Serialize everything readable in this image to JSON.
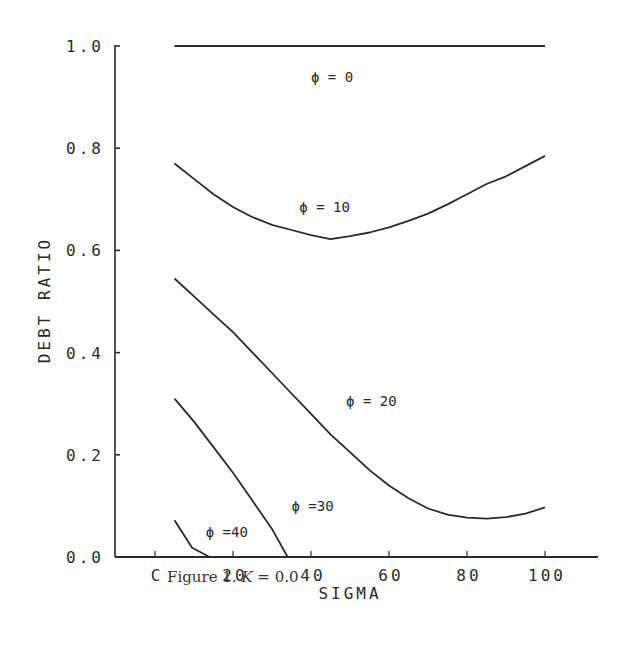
{
  "chart_data": {
    "type": "line",
    "title": "",
    "caption": "Figure 1. K = 0.0",
    "xlabel": "SIGMA",
    "ylabel": "DEBT RATIO",
    "xlim": [
      -10,
      115
    ],
    "ylim": [
      0.0,
      1.0
    ],
    "x_ticks": [
      0,
      20,
      40,
      60,
      80,
      100
    ],
    "x_tick_labels": [
      "C",
      "20",
      "40",
      "60",
      "80",
      "100"
    ],
    "y_ticks": [
      0.0,
      0.2,
      0.4,
      0.6,
      0.8,
      1.0
    ],
    "y_tick_labels": [
      "0.0",
      "0.2",
      "0.4",
      "0.6",
      "0.8",
      "1.0"
    ],
    "grid": false,
    "legend": "inline curve labels",
    "series": [
      {
        "name": "φ = 0",
        "label": "ϕ  =  0",
        "x": [
          5,
          100
        ],
        "y": [
          1.0,
          1.0
        ],
        "label_pos": [
          40,
          0.93
        ]
      },
      {
        "name": "φ = 10",
        "label": "ϕ  =  10",
        "x": [
          5,
          10,
          15,
          20,
          25,
          30,
          35,
          40,
          45,
          50,
          55,
          60,
          65,
          70,
          75,
          80,
          85,
          90,
          95,
          100
        ],
        "y": [
          0.77,
          0.74,
          0.71,
          0.685,
          0.665,
          0.65,
          0.64,
          0.63,
          0.622,
          0.628,
          0.635,
          0.645,
          0.658,
          0.672,
          0.69,
          0.71,
          0.73,
          0.745,
          0.765,
          0.785
        ],
        "label_pos": [
          37,
          0.675
        ]
      },
      {
        "name": "φ = 20",
        "label": "ϕ  =  20",
        "x": [
          5,
          10,
          15,
          20,
          25,
          30,
          35,
          40,
          45,
          50,
          55,
          60,
          65,
          70,
          75,
          80,
          85,
          90,
          95,
          100
        ],
        "y": [
          0.545,
          0.51,
          0.475,
          0.44,
          0.4,
          0.36,
          0.32,
          0.28,
          0.24,
          0.205,
          0.17,
          0.14,
          0.115,
          0.095,
          0.083,
          0.077,
          0.075,
          0.078,
          0.085,
          0.097
        ],
        "label_pos": [
          49,
          0.295
        ]
      },
      {
        "name": "φ = 30",
        "label": "ϕ  =30",
        "x": [
          5,
          10,
          15,
          20,
          25,
          30,
          34
        ],
        "y": [
          0.31,
          0.265,
          0.215,
          0.165,
          0.11,
          0.055,
          0.0
        ],
        "label_pos": [
          35,
          0.09
        ]
      },
      {
        "name": "φ = 40",
        "label": "ϕ  =40",
        "x": [
          5,
          9.5,
          14
        ],
        "y": [
          0.072,
          0.018,
          0.0
        ],
        "label_pos": [
          13,
          0.04
        ]
      }
    ]
  },
  "figure": {
    "caption_prefix": "Figure 1. ",
    "caption_var": "K",
    "caption_suffix": " = 0.0"
  }
}
